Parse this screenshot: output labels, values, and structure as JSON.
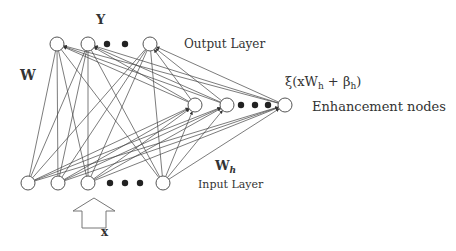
{
  "labels": {
    "output_symbol": "Y",
    "output_layer": "Output Layer",
    "weight_main": "W",
    "enhancement_formula": "ξ(xW",
    "enhancement_formula_sub_h": "h",
    "enhancement_formula_mid": " + β",
    "enhancement_formula_sub_h2": "h",
    "enhancement_formula_end": ")",
    "enhancement_nodes": "Enhancement nodes",
    "weight_h": "W",
    "weight_h_sub": "h",
    "input_layer": "Input Layer",
    "input_symbol": "x"
  },
  "colors": {
    "line": "#444444",
    "node_stroke": "#555555",
    "text": "#333333",
    "dot": "#222222"
  },
  "nodes": {
    "output": [
      {
        "x": 57,
        "y": 44
      },
      {
        "x": 88,
        "y": 44
      },
      {
        "x": 150,
        "y": 44
      }
    ],
    "output_ellipsis": [
      {
        "x": 107,
        "y": 44
      },
      {
        "x": 125,
        "y": 44
      }
    ],
    "enhancement": [
      {
        "x": 195,
        "y": 105
      },
      {
        "x": 227,
        "y": 105
      },
      {
        "x": 285,
        "y": 105
      }
    ],
    "enhancement_ellipsis": [
      {
        "x": 241,
        "y": 105
      },
      {
        "x": 255,
        "y": 105
      },
      {
        "x": 268,
        "y": 105
      }
    ],
    "input": [
      {
        "x": 28,
        "y": 183
      },
      {
        "x": 58,
        "y": 183
      },
      {
        "x": 88,
        "y": 183
      },
      {
        "x": 163,
        "y": 183
      }
    ],
    "input_ellipsis": [
      {
        "x": 110,
        "y": 183
      },
      {
        "x": 125,
        "y": 183
      },
      {
        "x": 140,
        "y": 183
      }
    ]
  }
}
